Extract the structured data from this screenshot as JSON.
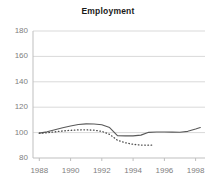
{
  "chart_data": {
    "type": "line",
    "title": "Employment",
    "xlabel": "",
    "ylabel": "",
    "xlim": [
      1987.6,
      1998.6
    ],
    "ylim": [
      80,
      180
    ],
    "grid": true,
    "legend": "none",
    "xticks": [
      1988,
      1990,
      1992,
      1994,
      1996,
      1998
    ],
    "yticks": [
      80,
      100,
      120,
      140,
      160,
      180
    ],
    "series": [
      {
        "name": "solid-series",
        "style": "solid",
        "color": "#595959",
        "x": [
          1988.0,
          1988.5,
          1989.0,
          1989.5,
          1990.0,
          1990.5,
          1991.0,
          1991.5,
          1992.0,
          1992.5,
          1993.0,
          1993.5,
          1994.0,
          1994.5,
          1995.0,
          1995.5,
          1996.0,
          1996.5,
          1997.0,
          1997.5,
          1998.0,
          1998.3
        ],
        "y": [
          99.6,
          100.6,
          102.2,
          103.8,
          105.2,
          106.4,
          106.9,
          106.8,
          106.2,
          104.0,
          97.6,
          97.4,
          97.4,
          98.0,
          100.2,
          100.5,
          100.5,
          100.4,
          100.3,
          101.0,
          102.8,
          104.0
        ]
      },
      {
        "name": "dotted-series",
        "style": "dotted",
        "color": "#4d4d4d",
        "x": [
          1988.0,
          1988.5,
          1989.0,
          1989.5,
          1990.0,
          1990.5,
          1991.0,
          1991.5,
          1992.0,
          1992.5,
          1993.0,
          1993.5,
          1994.0,
          1994.5,
          1995.0,
          1995.3
        ],
        "y": [
          99.5,
          99.9,
          100.6,
          101.3,
          101.8,
          102.1,
          102.2,
          101.9,
          101.0,
          98.6,
          94.0,
          92.0,
          90.8,
          90.2,
          90.1,
          90.2
        ]
      }
    ]
  },
  "axis": {
    "y_labels": [
      "180",
      "160",
      "140",
      "120",
      "100",
      "80"
    ],
    "x_labels": [
      "1988",
      "1990",
      "1992",
      "1994",
      "1996",
      "1998"
    ]
  },
  "colors": {
    "gridline": "#d9d9d9",
    "axis": "#bfbfbf",
    "tick_text": "#808080",
    "title_text": "#1a1a1a",
    "background": "#ffffff"
  }
}
